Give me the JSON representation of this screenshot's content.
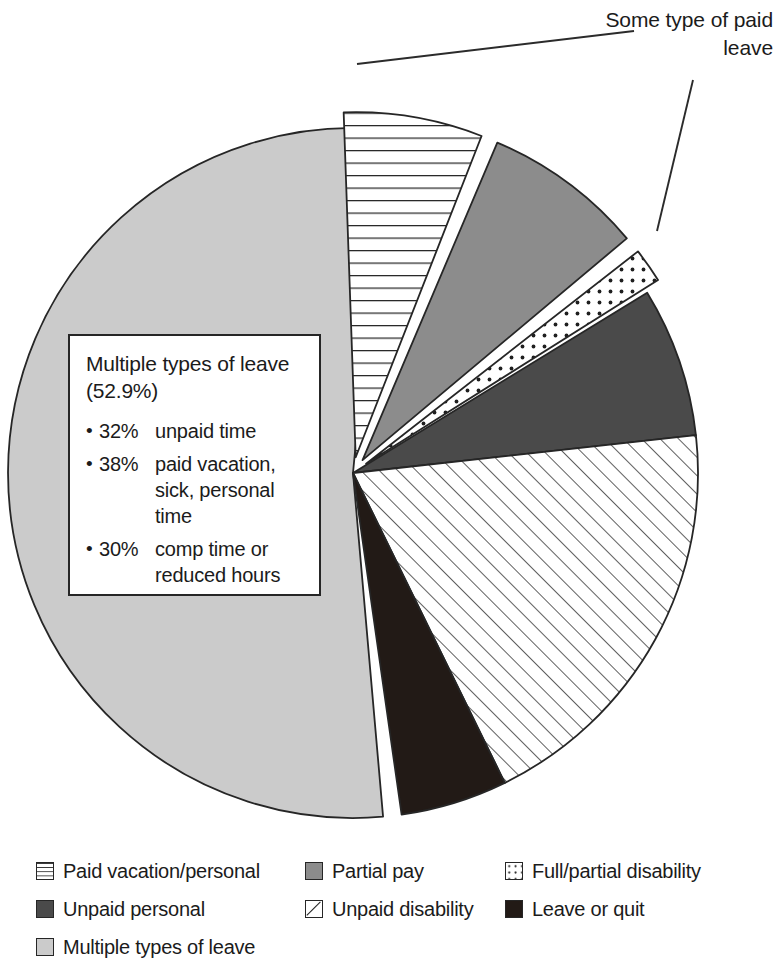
{
  "callout": {
    "text": "Some type of paid leave"
  },
  "note": {
    "title": "Multiple types of leave (52.9%)",
    "items": [
      {
        "bullet": "•",
        "pct": "32%",
        "text": "unpaid time"
      },
      {
        "bullet": "•",
        "pct": "38%",
        "text": "paid vacation, sick, personal time"
      },
      {
        "bullet": "•",
        "pct": "30%",
        "text": "comp time or reduced hours"
      }
    ]
  },
  "legend": {
    "columns": [
      {
        "items": [
          {
            "label": "Paid vacation/personal",
            "pattern": "horizontal-lines",
            "color": "#ffffff"
          },
          {
            "label": "Unpaid personal",
            "pattern": "solid",
            "color": "#4a4a4a"
          },
          {
            "label": "Multiple types of leave",
            "pattern": "solid",
            "color": "#cbcbcb"
          }
        ]
      },
      {
        "items": [
          {
            "label": "Partial pay",
            "pattern": "solid",
            "color": "#8c8c8c"
          },
          {
            "label": "Unpaid disability",
            "pattern": "diagonal-hatch",
            "color": "#ffffff"
          }
        ]
      },
      {
        "items": [
          {
            "label": "Full/partial disability",
            "pattern": "dots",
            "color": "#ffffff"
          },
          {
            "label": "Leave or quit",
            "pattern": "solid",
            "color": "#221a16"
          }
        ]
      }
    ]
  },
  "chart_data": {
    "type": "pie",
    "title": "",
    "subtitle": "",
    "legend_position": "bottom",
    "grid": false,
    "units": "percent",
    "total": 100,
    "annotations": [
      {
        "name": "paid-leave-callout",
        "text": "Some type of paid leave",
        "points_to": [
          "Paid vacation/personal",
          "Full/partial disability"
        ]
      },
      {
        "name": "multiple-leave-note",
        "text": "Multiple types of leave (52.9%)",
        "breakdown": [
          {
            "percent": 32,
            "label": "unpaid time"
          },
          {
            "percent": 38,
            "label": "paid vacation, sick, personal time"
          },
          {
            "percent": 30,
            "label": "comp time or reduced hours"
          }
        ]
      }
    ],
    "categories": [
      "Multiple types of leave",
      "Paid vacation/personal",
      "Partial pay",
      "Full/partial disability",
      "Unpaid personal",
      "Unpaid disability",
      "Leave or quit"
    ],
    "values": [
      52.9,
      6.5,
      7.5,
      1.6,
      7.0,
      19.5,
      5.0
    ],
    "slices": [
      {
        "label": "Multiple types of leave",
        "value": 52.9,
        "fill": "#cbcbcb",
        "pattern": "solid",
        "exploded": false,
        "start_deg": 175.0,
        "end_deg": 365.4
      },
      {
        "label": "Paid vacation/personal",
        "value": 6.5,
        "fill": "#ffffff",
        "pattern": "horizontal-lines",
        "exploded": true,
        "start_deg": 358.0,
        "end_deg": 381.4
      },
      {
        "label": "Partial pay",
        "value": 7.5,
        "fill": "#8c8c8c",
        "pattern": "solid",
        "exploded": true,
        "start_deg": 383.0,
        "end_deg": 410.0
      },
      {
        "label": "Full/partial disability",
        "value": 1.6,
        "fill": "#ffffff",
        "pattern": "dots",
        "exploded": true,
        "start_deg": 412.0,
        "end_deg": 417.8
      },
      {
        "label": "Unpaid personal",
        "value": 7.0,
        "fill": "#4a4a4a",
        "pattern": "solid",
        "exploded": false,
        "start_deg": 418.5,
        "end_deg": 443.7
      },
      {
        "label": "Unpaid disability",
        "value": 19.5,
        "fill": "#ffffff",
        "pattern": "diagonal-hatch",
        "exploded": false,
        "start_deg": 443.7,
        "end_deg": 513.9
      },
      {
        "label": "Leave or quit",
        "value": 5.0,
        "fill": "#221a16",
        "pattern": "solid",
        "exploded": false,
        "start_deg": 513.9,
        "end_deg": 531.9
      }
    ],
    "geometry": {
      "cx": 353,
      "cy": 473,
      "r": 345
    }
  },
  "colors": {
    "outline": "#262626",
    "light_gray": "#cbcbcb",
    "medium_gray": "#8c8c8c",
    "dark_gray": "#4a4a4a",
    "black": "#221a16",
    "white": "#ffffff"
  }
}
